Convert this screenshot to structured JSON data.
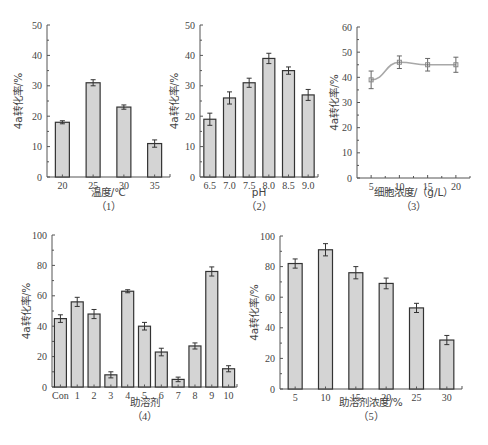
{
  "chart_data": [
    {
      "id": "c1",
      "type": "bar",
      "caption": "（1）",
      "xlabel": "温度/℃",
      "ylabel": "4a转化率/%",
      "categories": [
        "20",
        "25",
        "30",
        "35"
      ],
      "values": [
        18,
        31,
        23,
        11
      ],
      "errors": [
        0.5,
        1,
        0.7,
        1.2
      ],
      "ylim": [
        0,
        50
      ],
      "yticks": [
        0,
        10,
        20,
        30,
        40,
        50
      ],
      "grid": false,
      "colors": {
        "bar": "#d4d4d4",
        "edge": "#333333"
      }
    },
    {
      "id": "c2",
      "type": "bar",
      "caption": "（2）",
      "xlabel": "pH",
      "ylabel": "4a转化率/%",
      "categories": [
        "6.5",
        "7.0",
        "7.5",
        "8.0",
        "8.5",
        "9.0"
      ],
      "values": [
        19,
        26,
        31,
        39,
        35,
        27
      ],
      "errors": [
        2,
        2,
        1.5,
        1.7,
        1.2,
        1.8
      ],
      "ylim": [
        0,
        50
      ],
      "yticks": [
        0,
        10,
        20,
        30,
        40,
        50
      ],
      "grid": false,
      "colors": {
        "bar": "#d4d4d4",
        "edge": "#333333"
      }
    },
    {
      "id": "c3",
      "type": "line",
      "caption": "（3）",
      "xlabel": "细胞浓度/（g/L）",
      "ylabel": "4a转化率/%",
      "x": [
        5,
        10,
        15,
        20
      ],
      "values": [
        39,
        46,
        45,
        45
      ],
      "errors": [
        3.5,
        2.5,
        2.5,
        3
      ],
      "xlim": [
        2.5,
        22.5
      ],
      "xticks": [
        5,
        10,
        15,
        20
      ],
      "ylim": [
        0,
        60
      ],
      "yticks": [
        0,
        10,
        20,
        30,
        40,
        50,
        60
      ],
      "grid": false,
      "colors": {
        "line": "#a8a8a8",
        "marker": "#888888"
      }
    },
    {
      "id": "c4",
      "type": "bar",
      "caption": "（4）",
      "xlabel": "助溶剂",
      "ylabel": "4a转化率/%",
      "categories": [
        "Con",
        "1",
        "2",
        "3",
        "4",
        "5",
        "6",
        "7",
        "8",
        "9",
        "10"
      ],
      "values": [
        45,
        56,
        48,
        8,
        63,
        40,
        23,
        5,
        27,
        76,
        12
      ],
      "errors": [
        2.5,
        3,
        3,
        2,
        1,
        2.5,
        2.5,
        1.5,
        2,
        3,
        2
      ],
      "ylim": [
        0,
        100
      ],
      "yticks": [
        0,
        20,
        40,
        60,
        80,
        100
      ],
      "grid": false,
      "colors": {
        "bar": "#d4d4d4",
        "edge": "#333333"
      }
    },
    {
      "id": "c5",
      "type": "bar",
      "caption": "（5）",
      "xlabel": "助溶剂浓度/%",
      "ylabel": "4a转化率/%",
      "categories": [
        "5",
        "10",
        "15",
        "20",
        "25",
        "30"
      ],
      "values": [
        82,
        91,
        76,
        69,
        53,
        32
      ],
      "errors": [
        3,
        4,
        4,
        3.5,
        3,
        3
      ],
      "ylim": [
        0,
        100
      ],
      "yticks": [
        0,
        20,
        40,
        60,
        80,
        100
      ],
      "grid": false,
      "colors": {
        "bar": "#d4d4d4",
        "edge": "#333333"
      }
    }
  ]
}
